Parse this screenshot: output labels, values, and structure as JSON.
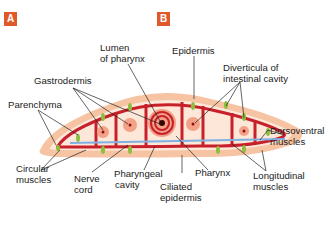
{
  "colors": {
    "badge": "#e0592a",
    "epidermis": "#f6c3a3",
    "epidermis_dots": "#e89a74",
    "parenchyma": "#fde7d8",
    "gastrodermis": "#c8202a",
    "diverticula": "#f3a187",
    "muscle_green": "#8cbf3f",
    "nerve_blue": "#7fb1e3",
    "leader_line": "#222222"
  },
  "panels": {
    "a": {
      "badge": "A"
    },
    "b": {
      "badge": "B"
    }
  },
  "labels": {
    "lumen_of_pharynx": [
      "Lumen",
      "of pharynx"
    ],
    "epidermis": "Epidermis",
    "gastrodermis": "Gastrodermis",
    "diverticula": [
      "Diverticula of",
      "intestinal cavity"
    ],
    "parenchyma": "Parenchyma",
    "dorsoventral_muscles": [
      "Dorsoventral",
      "muscles"
    ],
    "circular_muscles": [
      "Circular",
      "muscles"
    ],
    "nerve_cord": [
      "Nerve",
      "cord"
    ],
    "pharyngeal_cavity": [
      "Pharyngeal",
      "cavity"
    ],
    "ciliated_epidermis": [
      "Ciliated",
      "epidermis"
    ],
    "pharynx": "Pharynx",
    "longitudinal_muscles": [
      "Longitudinal",
      "muscles"
    ]
  }
}
